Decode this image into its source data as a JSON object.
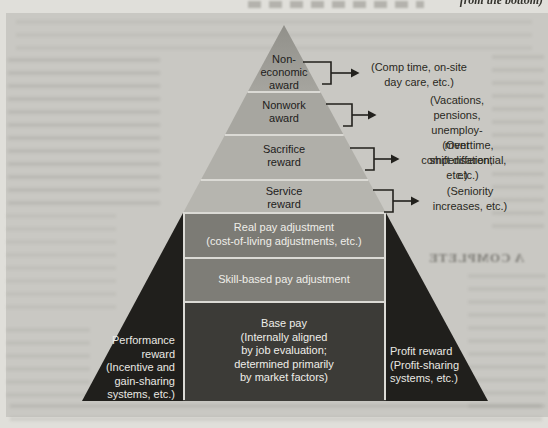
{
  "page": {
    "top_caption_fragment": "from the bottom)",
    "show_through_heading": "A COMPLETE"
  },
  "pyramid": {
    "tiers": [
      {
        "label": "Non-\neconomic\naward",
        "annotation": "(Comp time, on-site\nday care, etc.)"
      },
      {
        "label": "Nonwork\naward",
        "annotation": "(Vacations, pensions, unemploy-\nment compensation, etc.)"
      },
      {
        "label": "Sacrifice\nreward",
        "annotation": "(Overtime,\nshift differential, etc.)"
      },
      {
        "label": "Service\nreward",
        "annotation": "(Seniority\nincreases, etc.)"
      }
    ],
    "core": {
      "real_pay": "Real pay adjustment\n(cost-of-living adjustments, etc.)",
      "skill_pay": "Skill-based pay adjustment",
      "base_pay": "Base pay\n(Internally aligned\nby job evaluation;\ndetermined primarily\nby market factors)"
    },
    "left_wing": "Performance\nreward\n(Incentive and\ngain-sharing\nsystems, etc.)",
    "right_wing": "Profit reward\n(Profit-sharing\nsystems, etc.)"
  },
  "colors": {
    "page_bg": "#e0dfda",
    "panel_bg": "#c9c8c3",
    "tier1_top": "#91908a",
    "tier1_bottom": "#a6a59f",
    "tier2": "#a7a6a0",
    "tier3": "#b0afa9",
    "tier4": "#b6b5af",
    "core_band": "#7c7b75",
    "base_band": "#3c3b37",
    "wing_band": "#201f1c",
    "divider_line": "#dbdad5",
    "arrow_ink": "#22211d",
    "dark_text": "#21201b",
    "light_text": "#efeee9"
  }
}
